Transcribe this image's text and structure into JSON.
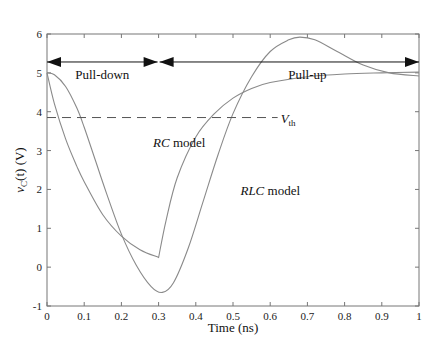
{
  "chart_data": {
    "type": "line",
    "title": "",
    "xlabel": "Time (ns)",
    "ylabel": "v_C(t) (V)",
    "ylabel_parts": {
      "main": "v",
      "sub": "C",
      "rest": "(t) (V)"
    },
    "xlim": [
      0,
      1
    ],
    "ylim": [
      -1,
      6
    ],
    "x_ticks": [
      0,
      0.1,
      0.2,
      0.3,
      0.4,
      0.5,
      0.6,
      0.7,
      0.8,
      0.9,
      1
    ],
    "x_tick_labels": [
      "0",
      "0.1",
      "0.2",
      "0.3",
      "0.4",
      "0.5",
      "0.6",
      "0.7",
      "0.8",
      "0.9",
      "1"
    ],
    "y_ticks": [
      -1,
      0,
      1,
      2,
      3,
      4,
      5,
      6
    ],
    "y_tick_labels": [
      "-1",
      "0",
      "1",
      "2",
      "3",
      "4",
      "5",
      "6"
    ],
    "grid": false,
    "legend": "none (inline annotations)",
    "series": [
      {
        "name": "RC model",
        "color": "#8a8a8a",
        "x": [
          0,
          0.02,
          0.05,
          0.08,
          0.1,
          0.15,
          0.2,
          0.25,
          0.3,
          0.32,
          0.35,
          0.4,
          0.45,
          0.5,
          0.55,
          0.6,
          0.7,
          0.8,
          0.9,
          1.0
        ],
        "y": [
          5.0,
          4.2,
          3.3,
          2.6,
          2.2,
          1.35,
          0.8,
          0.45,
          0.25,
          1.2,
          2.3,
          3.35,
          3.95,
          4.35,
          4.6,
          4.75,
          4.9,
          4.97,
          5.0,
          5.02
        ]
      },
      {
        "name": "RLC model",
        "color": "#8a8a8a",
        "x": [
          0,
          0.02,
          0.05,
          0.08,
          0.1,
          0.13,
          0.16,
          0.2,
          0.24,
          0.28,
          0.31,
          0.34,
          0.38,
          0.42,
          0.46,
          0.5,
          0.55,
          0.6,
          0.65,
          0.68,
          0.72,
          0.78,
          0.85,
          0.92,
          1.0
        ],
        "y": [
          5.0,
          4.95,
          4.65,
          4.1,
          3.6,
          2.75,
          1.9,
          0.85,
          0.05,
          -0.5,
          -0.65,
          -0.4,
          0.5,
          1.7,
          2.9,
          3.95,
          4.9,
          5.55,
          5.85,
          5.92,
          5.85,
          5.55,
          5.2,
          5.0,
          4.92
        ]
      }
    ],
    "annotations": {
      "vth": {
        "label_main": "V",
        "label_sub": "th",
        "value": 3.85,
        "x_end": 0.62,
        "style": "dashed"
      },
      "pull_down": {
        "label": "Pull-down",
        "x_start": 0,
        "x_end": 0.3,
        "y": 5.28
      },
      "pull_up": {
        "label": "Pull-up",
        "x_start": 0.3,
        "x_end": 1.0,
        "y": 5.28
      },
      "rc_label": {
        "italic": "RC",
        "rest": " model",
        "x": 0.285,
        "y": 3.1
      },
      "rlc_label": {
        "italic": "RLC",
        "rest": " model",
        "x": 0.52,
        "y": 1.85
      }
    }
  }
}
